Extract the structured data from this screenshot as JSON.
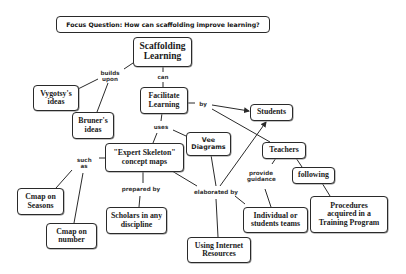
{
  "focus_question": "Focus Question: How can scaffolding improve learning?",
  "concepts": {
    "scaffolding_learning": "Scaffolding Learning",
    "vygotsky": "Vygotsy's ideas",
    "bruner": "Bruner's ideas",
    "facilitate_learning": "Facilitate Learning",
    "students": "Students",
    "vee_diagrams": "Vee Diagrams",
    "expert_skeleton": "\"Expert Skeleton\" concept maps",
    "teachers": "Teachers",
    "following": "following",
    "cmap_seasons": "Cmap on Seasons",
    "scholars": "Scholars in any discipline",
    "individual_teams": "Individual or students teams",
    "procedures": "Procedures acquired in a Training Program",
    "cmap_number": "Cmap on number",
    "internet": "Using Internet Resources"
  },
  "linking_phrases": {
    "builds_upon": "builds upon",
    "can": "can",
    "by": "by",
    "uses": "uses",
    "such_as": "such as",
    "prepared_by": "prepared by",
    "elaborated_by": "elaborated by",
    "provide_guidance": "provide guidance"
  },
  "colors": {
    "line": "#2a2a2a",
    "node_border": "#2a2a2a",
    "background": "#ffffff"
  }
}
